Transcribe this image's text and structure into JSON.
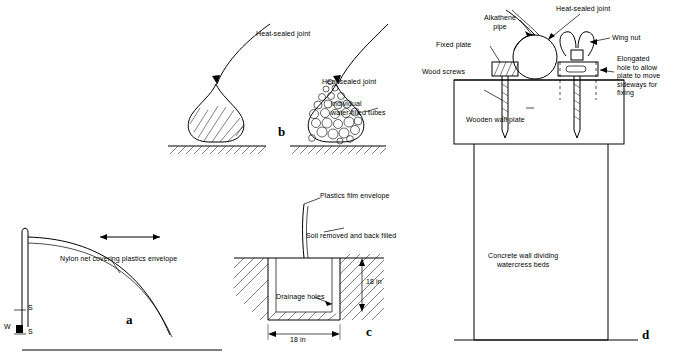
{
  "figure": {
    "panels": [
      {
        "id": "a",
        "letter": "a",
        "labels": [
          {
            "key": "nylon_net",
            "text": "Nylon net covering plastics envelope"
          },
          {
            "key": "s_upper",
            "text": "S"
          },
          {
            "key": "s_lower",
            "text": "S"
          },
          {
            "key": "w",
            "text": "W"
          }
        ]
      },
      {
        "id": "b",
        "letter": "b",
        "labels": [
          {
            "key": "heat_sealed_joint_left",
            "text": "Heat-sealed joint"
          },
          {
            "key": "heat_sealed_joint_right",
            "text": "Heat-sealed joint"
          },
          {
            "key": "individual_tubes",
            "text": "Individual\nwater-filled tubes"
          }
        ]
      },
      {
        "id": "c",
        "letter": "c",
        "labels": [
          {
            "key": "plastics_film_envelope",
            "text": "Plastics film envelope"
          },
          {
            "key": "soil_removed",
            "text": "Soil removed and back filled"
          },
          {
            "key": "drainage_holes",
            "text": "Drainage holes"
          },
          {
            "key": "depth",
            "text": "18 in"
          },
          {
            "key": "width",
            "text": "18 in"
          }
        ]
      },
      {
        "id": "d",
        "letter": "d",
        "labels": [
          {
            "key": "alkathene_pipe",
            "text": "Alkathene\npipe"
          },
          {
            "key": "heat_sealed_joint",
            "text": "Heat-sealed joint"
          },
          {
            "key": "wing_nut",
            "text": "Wing nut"
          },
          {
            "key": "fixed_plate",
            "text": "Fixed plate"
          },
          {
            "key": "elongated_hole",
            "text": "Elongated\nhole to allow\nplate to move\nsideways for\nfixing"
          },
          {
            "key": "wood_screws",
            "text": "Wood screws"
          },
          {
            "key": "wooden_wall_plate",
            "text": "Wooden wall plate"
          },
          {
            "key": "concrete_wall",
            "text": "Concrete wall dividing\nwatercress beds"
          }
        ]
      }
    ]
  }
}
